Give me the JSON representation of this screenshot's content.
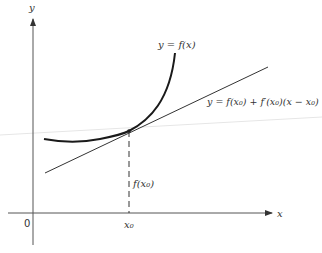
{
  "figure": {
    "axis_labels": {
      "x": "x",
      "y": "y",
      "origin": "0"
    },
    "curve_label": "y = f(x)",
    "tangent_label": "y = f(x₀) + f′(x₀)(x − x₀)",
    "height_label": "f(x₀)",
    "point_label": "x₀",
    "colors": {
      "curve": "#1a1a1a",
      "tangent": "#333333",
      "axis": "#555555",
      "background": "#ffffff"
    }
  }
}
